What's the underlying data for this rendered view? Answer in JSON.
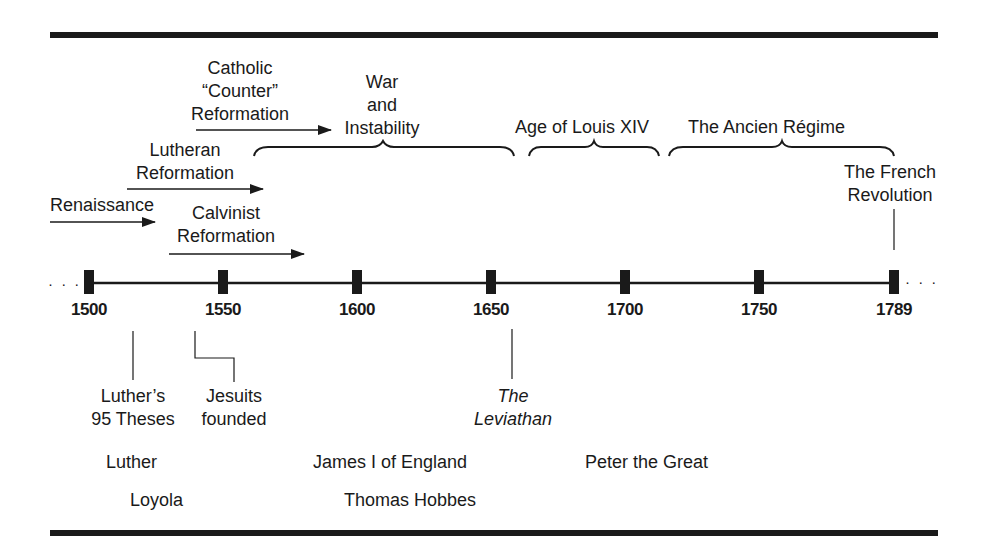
{
  "timeline": {
    "years": [
      {
        "label": "1500",
        "x": 89
      },
      {
        "label": "1550",
        "x": 223
      },
      {
        "label": "1600",
        "x": 357
      },
      {
        "label": "1650",
        "x": 491
      },
      {
        "label": "1700",
        "x": 625
      },
      {
        "label": "1750",
        "x": 759
      },
      {
        "label": "1789",
        "x": 894
      }
    ],
    "ellipsis_left": "· · ·",
    "ellipsis_right": "· · ·"
  },
  "movements": {
    "catholic_counter": {
      "line1": "Catholic",
      "line2": "“Counter”",
      "line3": "Reformation"
    },
    "war_instability": {
      "line1": "War",
      "line2": "and",
      "line3": "Instability"
    },
    "lutheran": {
      "line1": "Lutheran",
      "line2": "Reformation"
    },
    "renaissance": {
      "line1": "Renaissance"
    },
    "calvinist": {
      "line1": "Calvinist",
      "line2": "Reformation"
    },
    "louis_xiv": {
      "line1": "Age of Louis XIV"
    },
    "ancien_regime": {
      "line1": "The Ancien Régime"
    },
    "french_revolution": {
      "line1": "The French",
      "line2": "Revolution"
    }
  },
  "events": {
    "luthers_theses": {
      "line1": "Luther’s",
      "line2": "95 Theses"
    },
    "jesuits": {
      "line1": "Jesuits",
      "line2": "founded"
    },
    "leviathan": {
      "line1": "The",
      "line2": "Leviathan"
    }
  },
  "people": [
    {
      "name": "Luther"
    },
    {
      "name": "Loyola"
    },
    {
      "name": "James I of England"
    },
    {
      "name": "Thomas Hobbes"
    },
    {
      "name": "Peter the Great"
    }
  ],
  "colors": {
    "ink": "#1a1a1a",
    "background": "#ffffff"
  }
}
